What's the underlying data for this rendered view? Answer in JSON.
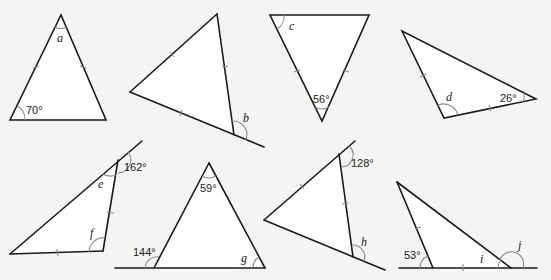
{
  "figures": [
    {
      "id": "t1",
      "labels": {
        "given": "70°",
        "unknown": "a"
      }
    },
    {
      "id": "t2",
      "labels": {
        "unknown": "b"
      }
    },
    {
      "id": "t3",
      "labels": {
        "unknown": "c",
        "given": "56°"
      }
    },
    {
      "id": "t4",
      "labels": {
        "unknown": "d",
        "given": "26°"
      }
    },
    {
      "id": "t5",
      "labels": {
        "given": "162°",
        "unknown_1": "e",
        "unknown_2": "f"
      }
    },
    {
      "id": "t6",
      "labels": {
        "given_1": "59°",
        "given_2": "144°",
        "unknown": "g"
      }
    },
    {
      "id": "t7",
      "labels": {
        "given": "128°",
        "unknown": "h"
      }
    },
    {
      "id": "t8",
      "labels": {
        "given": "53°",
        "unknown_1": "i",
        "unknown_2": "j"
      }
    }
  ],
  "colors": {
    "background": "#f4f4f2",
    "triangle_fill": "#ffffff",
    "line": "#1a1a1a",
    "arc": "#8a8a8a"
  }
}
